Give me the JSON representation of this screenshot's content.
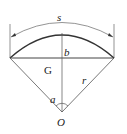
{
  "diagram": {
    "type": "circular-segment-geometry",
    "labels": {
      "arc_length": "s",
      "height": "b",
      "centroid": "G",
      "radius": "r",
      "angle": "a",
      "center": "O"
    },
    "colors": {
      "line": "#555555",
      "arc": "#333333",
      "background": "#ffffff"
    }
  }
}
